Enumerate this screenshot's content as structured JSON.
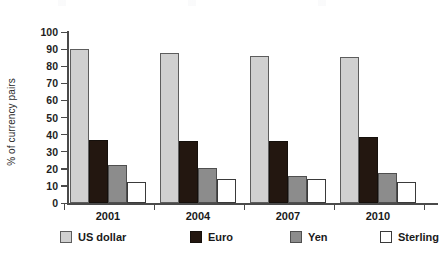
{
  "chart_data": {
    "type": "bar",
    "title": "",
    "subtitle": "",
    "xlabel": "",
    "ylabel": "% of currency pairs",
    "categories": [
      "2001",
      "2004",
      "2007",
      "2010"
    ],
    "series": [
      {
        "name": "US dollar",
        "color": "#d0d0d0",
        "values": [
          90,
          88,
          86,
          85.5
        ]
      },
      {
        "name": "Euro",
        "color": "#231710",
        "values": [
          37,
          36,
          36,
          38.5
        ]
      },
      {
        "name": "Yen",
        "color": "#8c8c8c",
        "values": [
          22.5,
          20.5,
          16,
          17.5
        ]
      },
      {
        "name": "Sterling",
        "color": "#ffffff",
        "values": [
          12,
          14,
          14,
          12
        ]
      }
    ],
    "ylim": [
      0,
      100
    ],
    "ytick_step": 10,
    "ytick_labels": [
      "0",
      "10",
      "20",
      "30",
      "40",
      "50",
      "60",
      "70",
      "80",
      "90",
      "100"
    ],
    "grid": false,
    "legend_position": "bottom",
    "annotations": []
  },
  "axes": {
    "y_title": "% of currency pairs",
    "y_ticks": [
      "100",
      "90",
      "80",
      "70",
      "60",
      "50",
      "40",
      "30",
      "20",
      "10",
      "0"
    ],
    "x_ticks": [
      "2001",
      "2004",
      "2007",
      "2010"
    ]
  },
  "legend": {
    "items": [
      {
        "label": "US dollar"
      },
      {
        "label": "Euro"
      },
      {
        "label": "Yen"
      },
      {
        "label": "Sterling"
      }
    ]
  }
}
